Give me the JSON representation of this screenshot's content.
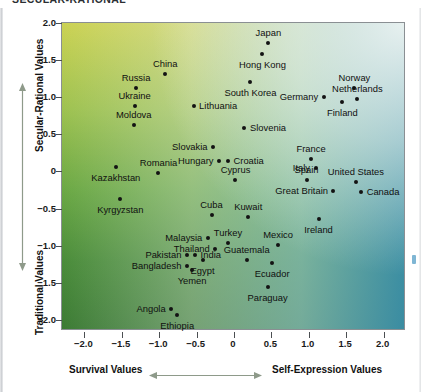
{
  "title": "SECULAR-RATIONAL",
  "chart_data": {
    "type": "scatter",
    "title": "",
    "xlabel_left": "Survival Values",
    "xlabel_right": "Self-Expression Values",
    "ylabel_top": "Secular-Rational Values",
    "ylabel_bottom": "Traditional Values",
    "xlim": [
      -2.3,
      2.3
    ],
    "ylim": [
      -2.15,
      2.0
    ],
    "grid": false,
    "legend": false,
    "xticks": [
      "-2.0",
      "-1.5",
      "-1.0",
      "-0.5",
      "0",
      "0.5",
      "1.0",
      "1.5",
      "2.0"
    ],
    "xtick_values": [
      -2.0,
      -1.5,
      -1.0,
      -0.5,
      0,
      0.5,
      1.0,
      1.5,
      2.0
    ],
    "yticks": [
      "2.0",
      "1.5",
      "1.0",
      "0.5",
      "0",
      "-0.5",
      "-1.0",
      "-1.5",
      "-2.0"
    ],
    "ytick_values": [
      2.0,
      1.5,
      1.0,
      0.5,
      0,
      -0.5,
      -1.0,
      -1.5,
      -2.0
    ],
    "background_colors": {
      "top_left": "#cbd253",
      "top_right": "#eef3ef",
      "bottom_left": "#3f7d35",
      "bottom_right": "#3a8fb5"
    },
    "point_color": "#131313",
    "points": [
      {
        "name": "Japan",
        "x": 0.46,
        "y": 1.73,
        "label_pos": "above"
      },
      {
        "name": "Hong Kong",
        "x": 0.38,
        "y": 1.58,
        "label_pos": "below"
      },
      {
        "name": "China",
        "x": -0.92,
        "y": 1.31,
        "label_pos": "above"
      },
      {
        "name": "South Korea",
        "x": 0.22,
        "y": 1.2,
        "label_pos": "below"
      },
      {
        "name": "Russia",
        "x": -1.31,
        "y": 1.13,
        "label_pos": "above"
      },
      {
        "name": "Norway",
        "x": 1.61,
        "y": 1.12,
        "label_pos": "above"
      },
      {
        "name": "Netherlands",
        "x": 1.65,
        "y": 0.98,
        "label_pos": "above"
      },
      {
        "name": "Germany",
        "x": 1.2,
        "y": 1.0,
        "label_pos": "left"
      },
      {
        "name": "Ukraine",
        "x": -1.33,
        "y": 0.88,
        "label_pos": "above"
      },
      {
        "name": "Lithuania",
        "x": -0.54,
        "y": 0.88,
        "label_pos": "right"
      },
      {
        "name": "Finland",
        "x": 1.45,
        "y": 0.94,
        "label_pos": "below"
      },
      {
        "name": "Moldova",
        "x": -1.34,
        "y": 0.62,
        "label_pos": "above"
      },
      {
        "name": "Slovenia",
        "x": 0.14,
        "y": 0.59,
        "label_pos": "right"
      },
      {
        "name": "Slovakia",
        "x": -0.28,
        "y": 0.33,
        "label_pos": "left"
      },
      {
        "name": "Croatia",
        "x": -0.08,
        "y": 0.14,
        "label_pos": "right"
      },
      {
        "name": "Hungary",
        "x": -0.2,
        "y": 0.14,
        "label_pos": "left"
      },
      {
        "name": "France",
        "x": 1.03,
        "y": 0.17,
        "label_pos": "above"
      },
      {
        "name": "Italy",
        "x": 1.09,
        "y": 0.04,
        "label_pos": "left"
      },
      {
        "name": "Kazakhstan",
        "x": -1.58,
        "y": 0.06,
        "label_pos": "below"
      },
      {
        "name": "Romania",
        "x": -1.01,
        "y": -0.02,
        "label_pos": "above"
      },
      {
        "name": "Cyprus",
        "x": 0.02,
        "y": -0.12,
        "label_pos": "above"
      },
      {
        "name": "Spain",
        "x": 0.97,
        "y": -0.11,
        "label_pos": "above"
      },
      {
        "name": "United States",
        "x": 1.63,
        "y": -0.14,
        "label_pos": "above"
      },
      {
        "name": "Great Britain",
        "x": 1.33,
        "y": -0.27,
        "label_pos": "left"
      },
      {
        "name": "Canada",
        "x": 1.7,
        "y": -0.28,
        "label_pos": "right"
      },
      {
        "name": "Kyrgyzstan",
        "x": -1.52,
        "y": -0.37,
        "label_pos": "below"
      },
      {
        "name": "Cuba",
        "x": -0.3,
        "y": -0.59,
        "label_pos": "above"
      },
      {
        "name": "Kuwait",
        "x": 0.19,
        "y": -0.61,
        "label_pos": "above"
      },
      {
        "name": "Ireland",
        "x": 1.13,
        "y": -0.64,
        "label_pos": "below"
      },
      {
        "name": "Malaysia",
        "x": -0.35,
        "y": -0.9,
        "label_pos": "left"
      },
      {
        "name": "Turkey",
        "x": -0.08,
        "y": -0.97,
        "label_pos": "above"
      },
      {
        "name": "Mexico",
        "x": 0.59,
        "y": -0.99,
        "label_pos": "above"
      },
      {
        "name": "Thailand",
        "x": -0.25,
        "y": -1.04,
        "label_pos": "left"
      },
      {
        "name": "Pakistan",
        "x": -0.63,
        "y": -1.12,
        "label_pos": "left"
      },
      {
        "name": "India",
        "x": -0.52,
        "y": -1.12,
        "label_pos": "right"
      },
      {
        "name": "Guatemala",
        "x": 0.17,
        "y": -1.19,
        "label_pos": "above"
      },
      {
        "name": "Egypt",
        "x": -0.42,
        "y": -1.2,
        "label_pos": "below"
      },
      {
        "name": "Ecuador",
        "x": 0.51,
        "y": -1.23,
        "label_pos": "below"
      },
      {
        "name": "Bangladesh",
        "x": -0.63,
        "y": -1.28,
        "label_pos": "left"
      },
      {
        "name": "Yemen",
        "x": -0.56,
        "y": -1.33,
        "label_pos": "below"
      },
      {
        "name": "Paraguay",
        "x": 0.45,
        "y": -1.56,
        "label_pos": "below"
      },
      {
        "name": "Angola",
        "x": -0.84,
        "y": -1.86,
        "label_pos": "left"
      },
      {
        "name": "Ethiopia",
        "x": -0.76,
        "y": -1.93,
        "label_pos": "below"
      }
    ]
  }
}
